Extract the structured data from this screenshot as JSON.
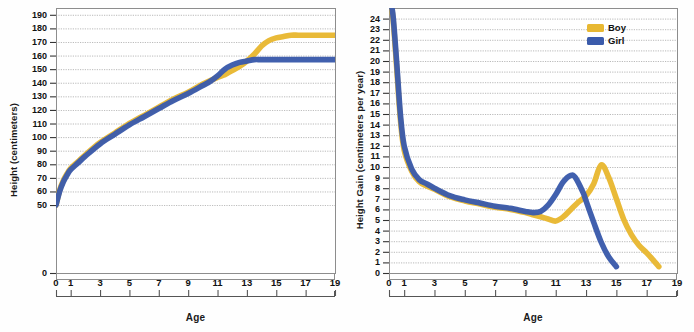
{
  "colors": {
    "boy": "#E8B832",
    "girl": "#3B5BAB",
    "grid": "#9a9a9a",
    "frame": "#8d8d8d",
    "text": "#111111"
  },
  "charts": [
    {
      "id": "height-chart",
      "type": "line",
      "title": "",
      "ylabel": "Height (centimeters)",
      "xlabel": "Age",
      "xlim": [
        0,
        19
      ],
      "ylim": [
        0,
        195
      ],
      "grid": true,
      "legend": null,
      "yticks": [
        0,
        50,
        60,
        70,
        80,
        90,
        100,
        110,
        120,
        130,
        140,
        150,
        160,
        170,
        180,
        190
      ],
      "ytick_labels": [
        "0",
        "50",
        "60",
        "70",
        "80",
        "90",
        "100",
        "110",
        "120",
        "130",
        "140",
        "150",
        "160",
        "170",
        "180",
        "190"
      ],
      "xticks": [
        0,
        1,
        3,
        5,
        7,
        9,
        11,
        13,
        15,
        17,
        19
      ],
      "xtick_labels": [
        "0",
        "1",
        "3",
        "5",
        "7",
        "9",
        "11",
        "13",
        "15",
        "17",
        "19"
      ],
      "series": [
        {
          "name": "Boy",
          "color": "#E8B832",
          "x": [
            0,
            0.25,
            0.5,
            0.75,
            1,
            1.5,
            2,
            3,
            4,
            5,
            6,
            7,
            8,
            9,
            10,
            11,
            11.5,
            12,
            12.5,
            13,
            13.5,
            14,
            14.5,
            15,
            15.5,
            16,
            16.5,
            17,
            18,
            19
          ],
          "values": [
            50,
            61,
            68,
            73,
            77,
            82,
            87,
            96,
            103,
            110,
            116,
            122,
            128,
            133,
            139,
            144,
            146,
            149,
            152,
            156,
            161,
            167,
            171,
            173,
            174,
            175,
            175,
            175,
            175,
            175
          ]
        },
        {
          "name": "Girl",
          "color": "#3B5BAB",
          "x": [
            0,
            0.25,
            0.5,
            0.75,
            1,
            1.5,
            2,
            3,
            4,
            5,
            6,
            7,
            8,
            9,
            10,
            10.5,
            11,
            11.5,
            12,
            12.5,
            13,
            13.5,
            14,
            15,
            16,
            17,
            18,
            19
          ],
          "values": [
            50,
            60,
            67,
            72,
            76,
            81,
            86,
            95,
            102,
            109,
            115,
            121,
            127,
            132,
            138,
            141,
            145,
            150,
            153,
            155,
            156,
            157,
            157,
            157,
            157,
            157,
            157,
            157
          ]
        }
      ]
    },
    {
      "id": "height-gain-chart",
      "type": "line",
      "title": "",
      "ylabel": "Height Gain (centimeters per year)",
      "xlabel": "Age",
      "xlim": [
        0,
        19
      ],
      "ylim": [
        0,
        25
      ],
      "grid": true,
      "legend": {
        "position": "top-right",
        "entries": [
          "Boy",
          "Girl"
        ]
      },
      "yticks": [
        0,
        1,
        2,
        3,
        4,
        5,
        6,
        7,
        8,
        9,
        10,
        11,
        12,
        13,
        14,
        15,
        16,
        17,
        18,
        19,
        20,
        21,
        22,
        23,
        24
      ],
      "ytick_labels": [
        "0",
        "1",
        "2",
        "3",
        "4",
        "5",
        "6",
        "7",
        "8",
        "9",
        "10",
        "11",
        "12",
        "13",
        "14",
        "15",
        "16",
        "17",
        "18",
        "19",
        "20",
        "21",
        "22",
        "23",
        "24"
      ],
      "xticks": [
        0,
        1,
        3,
        5,
        7,
        9,
        11,
        13,
        15,
        17,
        19
      ],
      "xtick_labels": [
        "0",
        "1",
        "3",
        "5",
        "7",
        "9",
        "11",
        "13",
        "15",
        "17",
        "19"
      ],
      "series": [
        {
          "name": "Boy",
          "color": "#E8B832",
          "x": [
            0.05,
            0.25,
            0.5,
            0.75,
            1,
            1.5,
            2,
            2.5,
            3,
            4,
            5,
            6,
            7,
            8,
            9,
            9.5,
            10,
            10.5,
            11,
            11.5,
            12,
            12.5,
            13,
            13.5,
            14,
            14.5,
            15,
            15.5,
            16,
            16.5,
            17,
            17.5,
            17.8
          ],
          "values": [
            25.5,
            24.2,
            19.5,
            14.5,
            11.6,
            9.6,
            8.6,
            8.2,
            7.9,
            7.2,
            6.8,
            6.5,
            6.2,
            6.0,
            5.7,
            5.5,
            5.3,
            5.1,
            4.9,
            5.3,
            6.0,
            6.7,
            7.3,
            8.4,
            10.2,
            9.0,
            7.0,
            5.0,
            3.6,
            2.6,
            1.9,
            1.1,
            0.6
          ]
        },
        {
          "name": "Girl",
          "color": "#3B5BAB",
          "x": [
            0.05,
            0.25,
            0.5,
            0.75,
            1,
            1.5,
            2,
            2.5,
            3,
            4,
            5,
            6,
            7,
            8,
            9,
            9.5,
            10,
            10.5,
            11,
            11.5,
            12,
            12.3,
            12.8,
            13,
            13.5,
            14,
            14.5,
            15
          ],
          "values": [
            25.5,
            24.5,
            20.0,
            15.0,
            12.0,
            9.8,
            8.8,
            8.4,
            8.0,
            7.3,
            6.9,
            6.6,
            6.3,
            6.1,
            5.8,
            5.7,
            5.8,
            6.4,
            7.4,
            8.6,
            9.2,
            9.0,
            7.6,
            6.8,
            4.8,
            2.9,
            1.5,
            0.6
          ]
        }
      ]
    }
  ]
}
